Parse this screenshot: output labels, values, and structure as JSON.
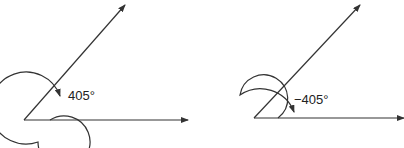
{
  "diagrams": [
    {
      "label": "405°",
      "direction": "counterclockwise"
    },
    {
      "label": "−405°",
      "direction": "clockwise"
    }
  ]
}
